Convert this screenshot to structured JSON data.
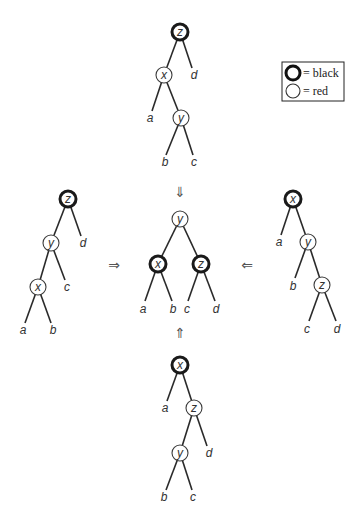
{
  "legend": {
    "black_label": "= black",
    "red_label": "= red"
  },
  "arrows": {
    "down": "⇓",
    "right": "⇒",
    "left": "⇐",
    "up": "⇑"
  },
  "trees": {
    "top": {
      "nodes": [
        {
          "id": "z",
          "label": "z",
          "color": "black"
        },
        {
          "id": "x",
          "label": "x",
          "color": "red"
        },
        {
          "id": "y",
          "label": "y",
          "color": "red"
        }
      ],
      "leaves": [
        "a",
        "b",
        "c",
        "d"
      ]
    },
    "left": {
      "nodes": [
        {
          "id": "z",
          "label": "z",
          "color": "black"
        },
        {
          "id": "y",
          "label": "y",
          "color": "red"
        },
        {
          "id": "x",
          "label": "x",
          "color": "red"
        }
      ],
      "leaves": [
        "a",
        "b",
        "c",
        "d"
      ]
    },
    "center": {
      "nodes": [
        {
          "id": "y",
          "label": "y",
          "color": "red"
        },
        {
          "id": "x",
          "label": "x",
          "color": "black"
        },
        {
          "id": "z",
          "label": "z",
          "color": "black"
        }
      ],
      "leaves": [
        "a",
        "b",
        "c",
        "d"
      ]
    },
    "right": {
      "nodes": [
        {
          "id": "x",
          "label": "x",
          "color": "black"
        },
        {
          "id": "y",
          "label": "y",
          "color": "red"
        },
        {
          "id": "z",
          "label": "z",
          "color": "red"
        }
      ],
      "leaves": [
        "a",
        "b",
        "c",
        "d"
      ]
    },
    "bottom": {
      "nodes": [
        {
          "id": "x",
          "label": "x",
          "color": "black"
        },
        {
          "id": "z",
          "label": "z",
          "color": "red"
        },
        {
          "id": "y",
          "label": "y",
          "color": "red"
        }
      ],
      "leaves": [
        "a",
        "b",
        "c",
        "d"
      ]
    }
  }
}
